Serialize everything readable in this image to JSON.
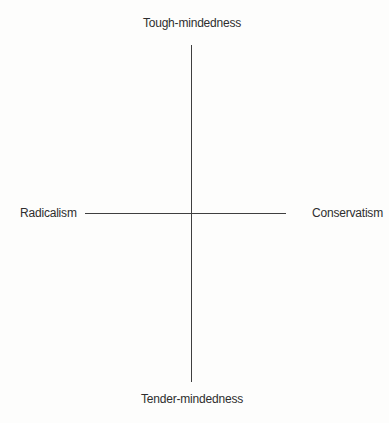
{
  "diagram": {
    "type": "axes-cross",
    "axis_labels": {
      "top": "Tough-mindedness",
      "bottom": "Tender-mindedness",
      "left": "Radicalism",
      "right": "Conservatism"
    },
    "colors": {
      "line": "#3f3f3f",
      "text": "#2e2e2e",
      "background": "#fdfdfc"
    }
  }
}
